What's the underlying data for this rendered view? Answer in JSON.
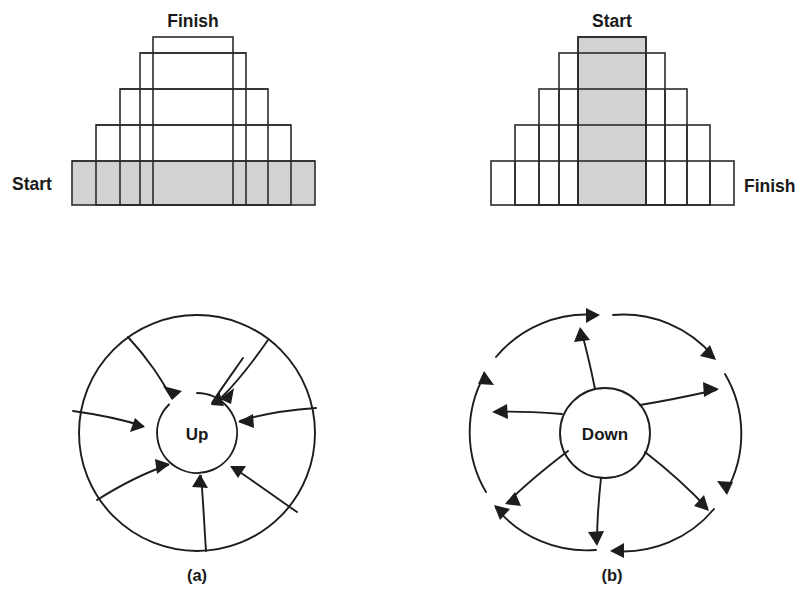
{
  "figure": {
    "background_color": "#ffffff",
    "ink_color": "#1d1d1d",
    "shade_color": "#d0d0d0"
  },
  "panel_a": {
    "caption": "(a)",
    "pyramid": {
      "name": "upward-convergent-pyramid",
      "start_label": "Start",
      "finish_label": "Finish",
      "start_position": "bottom-left",
      "finish_position": "top-center",
      "shaded_level": "bottom",
      "levels": 5,
      "level_widths_px": [
        243,
        195,
        148,
        106,
        80
      ],
      "level_heights_px": [
        44,
        36,
        36,
        36,
        40
      ]
    },
    "wheel": {
      "name": "inward-spiral-wheel",
      "center_label": "Up",
      "arrow_direction": "inward",
      "spoke_count": 8,
      "outer_radius_px": 118,
      "inner_radius_px": 40
    }
  },
  "panel_b": {
    "caption": "(b)",
    "pyramid": {
      "name": "downward-divergent-pyramid",
      "start_label": "Start",
      "finish_label": "Finish",
      "start_position": "top-center",
      "finish_position": "bottom-right",
      "shaded_level": "center-column",
      "levels": 5,
      "level_widths_px": [
        243,
        195,
        148,
        106,
        80
      ],
      "level_heights_px": [
        44,
        36,
        36,
        36,
        40
      ]
    },
    "wheel": {
      "name": "outward-spiral-wheel",
      "center_label": "Down",
      "arrow_direction": "outward",
      "spoke_count": 6,
      "outer_arrow_count": 6,
      "outer_radius_px": 118,
      "inner_radius_px": 45
    }
  }
}
